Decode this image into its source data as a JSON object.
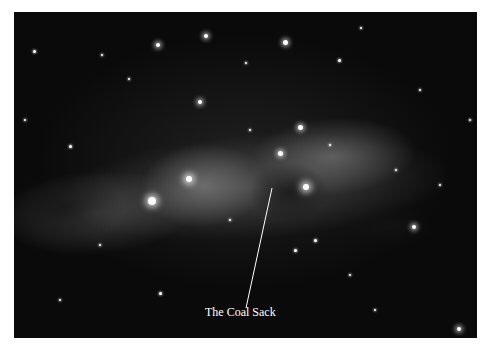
{
  "image": {
    "description": "Black-and-white astrophotograph of a Milky Way star field with a dark nebula",
    "annotation": {
      "label": "The Coal Sack",
      "label_color": "#ffffff"
    }
  },
  "stars": [
    {
      "x": 152,
      "y": 201,
      "r": 4,
      "size": "big"
    },
    {
      "x": 189,
      "y": 179,
      "r": 3,
      "size": "big"
    },
    {
      "x": 306,
      "y": 187,
      "r": 3,
      "size": "big"
    },
    {
      "x": 280,
      "y": 153,
      "r": 2.5,
      "size": "med"
    },
    {
      "x": 300,
      "y": 127,
      "r": 2.5,
      "size": "med"
    },
    {
      "x": 200,
      "y": 102,
      "r": 2,
      "size": "med"
    },
    {
      "x": 206,
      "y": 36,
      "r": 2,
      "size": "med"
    },
    {
      "x": 158,
      "y": 45,
      "r": 2,
      "size": "med"
    },
    {
      "x": 285,
      "y": 42,
      "r": 2.5,
      "size": "med"
    },
    {
      "x": 339,
      "y": 60,
      "r": 1.5,
      "size": "sm"
    },
    {
      "x": 414,
      "y": 227,
      "r": 2,
      "size": "med"
    },
    {
      "x": 459,
      "y": 329,
      "r": 2,
      "size": "med"
    },
    {
      "x": 70,
      "y": 146,
      "r": 1.5,
      "size": "sm"
    },
    {
      "x": 34,
      "y": 51,
      "r": 1.5,
      "size": "sm"
    },
    {
      "x": 102,
      "y": 55,
      "r": 1.2,
      "size": "sm"
    },
    {
      "x": 129,
      "y": 79,
      "r": 1.2,
      "size": "sm"
    },
    {
      "x": 246,
      "y": 63,
      "r": 1.2,
      "size": "sm"
    },
    {
      "x": 361,
      "y": 28,
      "r": 1.2,
      "size": "sm"
    },
    {
      "x": 420,
      "y": 90,
      "r": 1.2,
      "size": "sm"
    },
    {
      "x": 160,
      "y": 293,
      "r": 1.5,
      "size": "sm"
    },
    {
      "x": 295,
      "y": 250,
      "r": 1.5,
      "size": "sm"
    },
    {
      "x": 315,
      "y": 240,
      "r": 1.5,
      "size": "sm"
    },
    {
      "x": 350,
      "y": 275,
      "r": 1.2,
      "size": "sm"
    },
    {
      "x": 440,
      "y": 185,
      "r": 1.2,
      "size": "sm"
    },
    {
      "x": 60,
      "y": 300,
      "r": 1.2,
      "size": "sm"
    },
    {
      "x": 100,
      "y": 245,
      "r": 1.2,
      "size": "sm"
    },
    {
      "x": 470,
      "y": 120,
      "r": 1.2,
      "size": "sm"
    },
    {
      "x": 230,
      "y": 220,
      "r": 1.2,
      "size": "sm"
    },
    {
      "x": 396,
      "y": 170,
      "r": 1.2,
      "size": "sm"
    },
    {
      "x": 25,
      "y": 120,
      "r": 1,
      "size": "sm"
    },
    {
      "x": 375,
      "y": 310,
      "r": 1,
      "size": "sm"
    },
    {
      "x": 250,
      "y": 130,
      "r": 1,
      "size": "sm"
    },
    {
      "x": 330,
      "y": 145,
      "r": 1,
      "size": "sm"
    }
  ]
}
